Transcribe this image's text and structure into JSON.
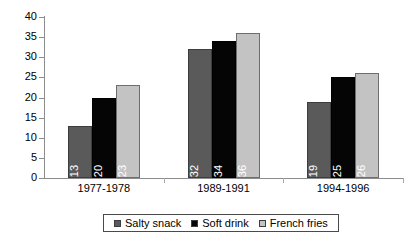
{
  "chart_data": {
    "type": "bar",
    "title": "",
    "subtitle": "",
    "xlabel": "",
    "ylabel": "",
    "categories": [
      "1977-1978",
      "1989-1991",
      "1994-1996"
    ],
    "series": [
      {
        "name": "Salty snack",
        "values": [
          13,
          32,
          19
        ],
        "color": "#5a5a5a"
      },
      {
        "name": "Soft drink",
        "values": [
          20,
          34,
          25
        ],
        "color": "#050505"
      },
      {
        "name": "French fries",
        "values": [
          23,
          36,
          26
        ],
        "color": "#c3c3c3"
      }
    ],
    "series_by_group": [
      {
        "category": "1977-1978",
        "Salty snack": 13,
        "Soft drink": 32,
        "French fries": 19
      },
      {
        "category": "1989-1991",
        "Salty snack": 20,
        "Soft drink": 34,
        "French fries": 25
      },
      {
        "category": "1994-1996",
        "Salty snack": 23,
        "Soft drink": 36,
        "French fries": 26
      }
    ],
    "data_labels": [
      13,
      32,
      19,
      20,
      34,
      25,
      23,
      36,
      26
    ],
    "ylim": [
      0,
      40
    ],
    "ytick_step": 5,
    "yticks": [
      0,
      5,
      10,
      15,
      20,
      25,
      30,
      35,
      40
    ],
    "ytick_labels": [
      "0",
      "5",
      "10",
      "15",
      "20",
      "25",
      "30",
      "35",
      "40"
    ],
    "grid": false,
    "legend_position": "bottom",
    "data_labels_rotated": true
  },
  "axis": {
    "y_labels": [
      "40",
      "35",
      "30",
      "25",
      "20",
      "15",
      "10",
      "5",
      "0"
    ],
    "x_labels": [
      "1977-1978",
      "1989-1991",
      "1994-1996"
    ]
  },
  "legend": {
    "items": [
      {
        "label": "Salty snack"
      },
      {
        "label": "Soft drink"
      },
      {
        "label": "French fries"
      }
    ]
  }
}
